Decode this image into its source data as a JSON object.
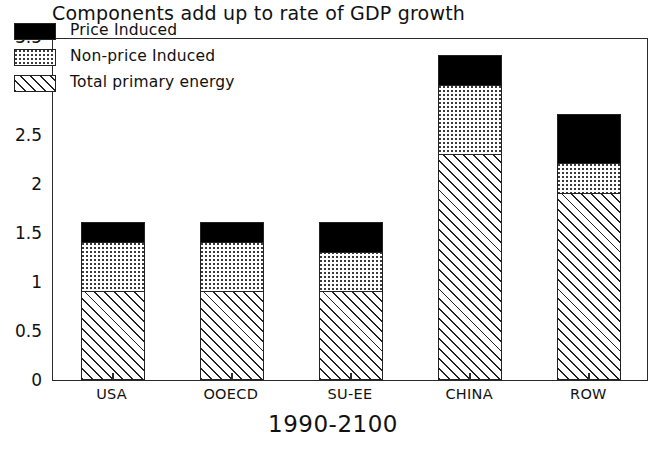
{
  "chart_data": {
    "type": "bar",
    "stacked": true,
    "title": "Components add up to rate of GDP growth",
    "xlabel": "1990-2100",
    "ylabel": "",
    "categories": [
      "USA",
      "OOECD",
      "SU-EE",
      "CHINA",
      "ROW"
    ],
    "ylim": [
      0,
      3.5
    ],
    "yticks": [
      0,
      0.5,
      1,
      1.5,
      2,
      2.5,
      3,
      3.5
    ],
    "ytick_labels": [
      "0",
      "0.5",
      "1",
      "1.5",
      "2",
      "2.5",
      "3",
      "3.5"
    ],
    "grid": false,
    "legend_position": "upper left",
    "series": [
      {
        "name": "Total primary energy",
        "pattern": "diagonal-hatch",
        "values": [
          0.9,
          0.9,
          0.9,
          2.3,
          1.9
        ]
      },
      {
        "name": "Non-price Induced",
        "pattern": "dotted",
        "values": [
          0.5,
          0.5,
          0.4,
          0.7,
          0.3
        ]
      },
      {
        "name": "Price Induced",
        "pattern": "solid-black",
        "values": [
          0.2,
          0.2,
          0.3,
          0.3,
          0.5
        ]
      }
    ],
    "cumulative_tops": {
      "USA": {
        "total_primary_energy": 0.9,
        "non_price_induced": 1.4,
        "price_induced": 1.6
      },
      "OOECD": {
        "total_primary_energy": 0.9,
        "non_price_induced": 1.4,
        "price_induced": 1.6
      },
      "SU-EE": {
        "total_primary_energy": 0.9,
        "non_price_induced": 1.3,
        "price_induced": 1.6
      },
      "CHINA": {
        "total_primary_energy": 2.3,
        "non_price_induced": 3.0,
        "price_induced": 3.3
      },
      "ROW": {
        "total_primary_energy": 1.9,
        "non_price_induced": 2.2,
        "price_induced": 2.7
      }
    },
    "totals": [
      1.6,
      1.6,
      1.6,
      3.3,
      2.7
    ],
    "colors": {
      "price_induced": "#000000",
      "non_price_induced": "#ffffff",
      "total_primary_energy": "#ffffff",
      "outline": "#222222",
      "axis": "#2a2a2a",
      "background": "#ffffff"
    }
  },
  "legend": {
    "items": [
      {
        "label": "Price Induced",
        "swatch": "solid-black"
      },
      {
        "label": "Non-price Induced",
        "swatch": "dotted"
      },
      {
        "label": "Total primary energy",
        "swatch": "diagonal-hatch"
      }
    ]
  }
}
